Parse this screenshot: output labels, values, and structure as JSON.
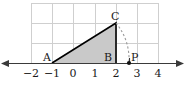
{
  "figure": {
    "background_color": "#ffffff",
    "axis_color": "#3a3a3a",
    "grid_color": "#cfcfcf",
    "triangle_fill": "#c9c9c9",
    "triangle_stroke": "#000000",
    "arc_color": "#9a9a9a"
  },
  "axis": {
    "name": "number-line",
    "ticks": [
      {
        "value": -2,
        "label": "−2",
        "x": 31
      },
      {
        "value": -1,
        "label": "−1",
        "x": 52
      },
      {
        "value": 0,
        "label": "0",
        "x": 73
      },
      {
        "value": 1,
        "label": "1",
        "x": 95
      },
      {
        "value": 2,
        "label": "2",
        "x": 116
      },
      {
        "value": 3,
        "label": "3",
        "x": 137
      },
      {
        "value": 4,
        "label": "4",
        "x": 158
      }
    ],
    "label_y": 68,
    "line_y": 63,
    "left_arrow_x": 5,
    "right_arrow_x": 180
  },
  "grid": {
    "x_lines": [
      31,
      52,
      73,
      95,
      116,
      137,
      158
    ],
    "y_lines": [
      3,
      23,
      43,
      63
    ],
    "top": 3,
    "bottom": 63,
    "left": 31,
    "right": 158
  },
  "points": [
    {
      "name": "A",
      "label": "A",
      "value": -1,
      "px": 52,
      "py": 63,
      "label_x": 43,
      "label_y": 52,
      "dot": false
    },
    {
      "name": "B",
      "label": "B",
      "value": 2,
      "px": 116,
      "py": 63,
      "label_x": 104,
      "label_y": 52,
      "dot": false
    },
    {
      "name": "C",
      "label": "C",
      "value": 2,
      "px": 116,
      "py": 23,
      "label_x": 111,
      "label_y": 11,
      "dot": false
    },
    {
      "name": "P",
      "label": "P",
      "value": 2.6,
      "px": 129,
      "py": 63,
      "label_x": 131,
      "label_y": 52,
      "dot": true
    }
  ],
  "triangle": {
    "name": "shaded-right-triangle",
    "vertices": "52,63 116,63 116,23",
    "vertex_labels": [
      "A",
      "B",
      "C"
    ]
  },
  "arc": {
    "name": "compass-arc-C-to-P",
    "path": "M 116 23 Q 130 40 129 63",
    "style": "dashed"
  },
  "tick_marks": {
    "p_tick": {
      "x": 129,
      "y1": 58,
      "y2": 63
    }
  }
}
